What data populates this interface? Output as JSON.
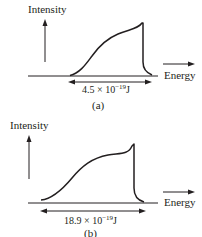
{
  "colors": {
    "ink": "#231f20",
    "background": "#ffffff"
  },
  "panels": [
    {
      "id": "a",
      "y_axis_label": "Intensity",
      "x_axis_label": "Energy",
      "range_mantissa": "4.5 × 10",
      "range_exponent": "−19",
      "range_unit": "J",
      "caption": "(a)"
    },
    {
      "id": "b",
      "y_axis_label": "Intensity",
      "x_axis_label": "Energy",
      "range_mantissa": "18.9 × 10",
      "range_exponent": "−19",
      "range_unit": "J",
      "caption": "(b)"
    }
  ]
}
